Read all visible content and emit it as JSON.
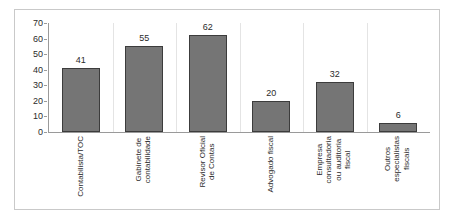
{
  "chart_data": {
    "type": "bar",
    "title": "",
    "subtitle": "",
    "xlabel": "",
    "ylabel": "",
    "categories": [
      "Contabilista/TOC",
      "Gabinete de contabilidade",
      "Revisor Oficial de Contas",
      "Advogado fiscal",
      "Empresa consultadoria ou auditoria fiscal",
      "Outros especialistas fiscais"
    ],
    "category_lines": [
      [
        "Contabilista/TOC"
      ],
      [
        "Gabinete de",
        "contabilidade"
      ],
      [
        "Revisor Oficial",
        "de Contas"
      ],
      [
        "Advogado fiscal"
      ],
      [
        "Empresa",
        "consultadoria",
        "ou auditoria",
        "fiscal"
      ],
      [
        "Outros",
        "especialistas",
        "fiscais"
      ]
    ],
    "values": [
      41,
      55,
      62,
      20,
      32,
      6
    ],
    "data_labels": [
      "41",
      "55",
      "62",
      "20",
      "32",
      "6"
    ],
    "ylim": [
      0,
      70
    ],
    "ytick_step": 10,
    "yticks": [
      70,
      60,
      50,
      40,
      30,
      20,
      10,
      0
    ],
    "ytick_labels": [
      "70",
      "60",
      "50",
      "40",
      "30",
      "20",
      "10",
      "0"
    ],
    "grid": "vertical-category-separators",
    "legend": "none",
    "legend_position": "none",
    "orientation": "vertical",
    "xtick_label_rotation": -90,
    "colors": {
      "bar_fill": "#757575",
      "bar_border": "#3c3c3c",
      "axis": "#9a9a9a",
      "gridline": "#e4e4e4",
      "text": "#2b2b2b",
      "frame_border": "#c9c9c9",
      "background": "#ffffff"
    }
  }
}
